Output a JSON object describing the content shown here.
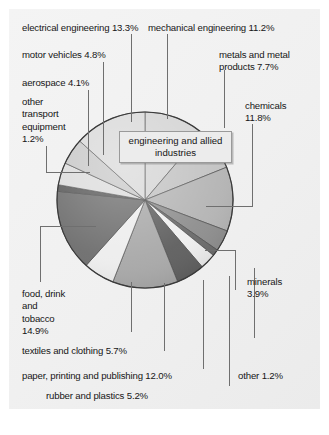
{
  "figure": {
    "center_callout": "engineering and\nallied industries",
    "background_color": "#f2f2f2",
    "leader_color": "#6f6f6f",
    "text_color": "#161616",
    "bottom_fragment": ""
  },
  "labels": {
    "electrical_engineering": "electrical engineering 13.3%",
    "mechanical_engineering": "mechanical engineering 11.2%",
    "motor_vehicles": "motor vehicles 4.8%",
    "metals_and_metal_products": "metals and metal\nproducts 7.7%",
    "aerospace": "aerospace 4.1%",
    "other_transport_equipment": "other\ntransport\nequipment\n1.2%",
    "chemicals": "chemicals\n11.8%",
    "minerals": "minerals\n3.9%",
    "food_drink_and_tobacco": "food, drink\nand\ntobacco\n14.9%",
    "textiles_and_clothing": "textiles and clothing 5.7%",
    "paper_printing_and_publishing": "paper, printing and publishing 12.0%",
    "rubber_and_plastics": "rubber and plastics 5.2%",
    "wood_products": "wood products 2.9%",
    "other": "other 1.2%"
  },
  "chart_data": {
    "type": "pie",
    "title": "",
    "subtitle": "",
    "center_annotation": "engineering and allied industries",
    "units": "percent",
    "total": 100.0,
    "legend_position": "callout-labels",
    "grid": false,
    "categories": [
      "mechanical engineering",
      "metals and metal products",
      "chemicals",
      "minerals",
      "other",
      "wood products",
      "rubber and plastics",
      "paper, printing and publishing",
      "textiles and clothing",
      "food, drink and tobacco",
      "other transport equipment",
      "aerospace",
      "motor vehicles",
      "electrical engineering"
    ],
    "values": [
      11.2,
      7.7,
      11.8,
      3.9,
      1.2,
      2.9,
      5.2,
      12.0,
      5.7,
      14.9,
      1.2,
      4.1,
      4.8,
      13.3
    ],
    "slices": [
      {
        "label": "mechanical engineering",
        "value": 11.2,
        "color": "#d4d4d4"
      },
      {
        "label": "metals and metal products",
        "value": 7.7,
        "color": "#c2c2c2"
      },
      {
        "label": "chemicals",
        "value": 11.8,
        "color": "#b4b4b4"
      },
      {
        "label": "minerals",
        "value": 3.9,
        "color": "#8e8e8e"
      },
      {
        "label": "other",
        "value": 1.2,
        "color": "#6b6b6b"
      },
      {
        "label": "wood products",
        "value": 2.9,
        "color": "#efefef"
      },
      {
        "label": "rubber and plastics",
        "value": 5.2,
        "color": "#5f5f5f"
      },
      {
        "label": "paper, printing and publishing",
        "value": 12.0,
        "color": "#a8a8a8"
      },
      {
        "label": "textiles and clothing",
        "value": 5.7,
        "color": "#ededed"
      },
      {
        "label": "food, drink and tobacco",
        "value": 14.9,
        "color": "#6e6e6e"
      },
      {
        "label": "other transport equipment",
        "value": 1.2,
        "color": "#5a5a5a"
      },
      {
        "label": "aerospace",
        "value": 4.1,
        "color": "#dcdcdc"
      },
      {
        "label": "motor vehicles",
        "value": 4.8,
        "color": "#c8c8c8"
      },
      {
        "label": "electrical engineering",
        "value": 13.3,
        "color": "#d9d9d9"
      }
    ]
  }
}
